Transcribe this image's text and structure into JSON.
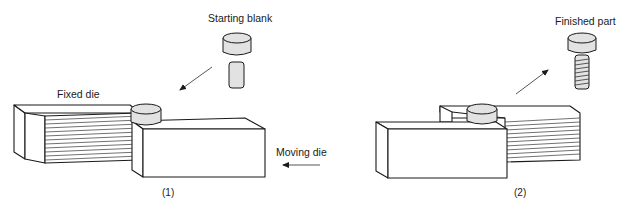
{
  "figure": {
    "panels": [
      {
        "caption": "(1)",
        "labels": {
          "starting_blank": "Starting blank",
          "fixed_die": "Fixed die",
          "moving_die": "Moving die"
        }
      },
      {
        "caption": "(2)",
        "labels": {
          "finished_part": "Finished part"
        }
      }
    ],
    "colors": {
      "line": "#1a1a1a",
      "part_fill": "#e2e2e2",
      "background": "#ffffff"
    }
  }
}
